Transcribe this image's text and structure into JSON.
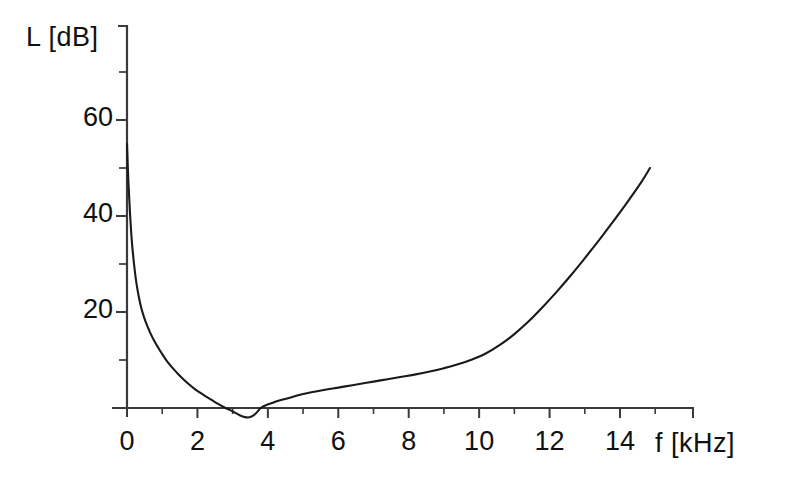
{
  "chart_data": {
    "type": "line",
    "title": "",
    "xlabel": "f [kHz]",
    "ylabel": "L [dB]",
    "xlim": [
      -0.35,
      15.55
    ],
    "ylim": [
      -6,
      80
    ],
    "grid": false,
    "legend": null,
    "x_ticks_major": [
      0,
      2,
      4,
      6,
      8,
      10,
      12,
      14
    ],
    "x_tick_labels": [
      "0",
      "2",
      "4",
      "6",
      "8",
      "10",
      "12",
      "14"
    ],
    "x_ticks_minor": [
      1,
      3,
      5,
      7,
      9,
      11,
      13,
      15
    ],
    "y_ticks_major": [
      20,
      40,
      60
    ],
    "y_tick_labels": [
      "20",
      "40",
      "60"
    ],
    "y_ticks_minor": [
      10,
      30,
      50,
      70
    ],
    "series": [
      {
        "name": "L(f)",
        "color": "#1a1a1a",
        "x": [
          0.0,
          0.04,
          0.09,
          0.14,
          0.2,
          0.26,
          0.33,
          0.4,
          0.48,
          0.57,
          0.67,
          0.78,
          0.9,
          1.02,
          1.15,
          1.3,
          1.45,
          1.6,
          1.75,
          1.9,
          2.05,
          2.2,
          2.4,
          2.6,
          2.8,
          3.0,
          3.2,
          3.35,
          3.5,
          3.65,
          3.8,
          3.95,
          4.1,
          4.3,
          4.6,
          5.0,
          5.4,
          5.8,
          6.2,
          6.6,
          7.0,
          7.4,
          7.8,
          8.2,
          8.6,
          9.0,
          9.4,
          9.8,
          10.2,
          10.6,
          11.0,
          11.4,
          11.8,
          12.2,
          12.6,
          13.0,
          13.4,
          13.8,
          14.2,
          14.6,
          14.85
        ],
        "y": [
          55.0,
          47.0,
          40.0,
          34.5,
          30.0,
          26.4,
          23.4,
          21.0,
          19.0,
          17.2,
          15.5,
          13.9,
          12.4,
          11.0,
          9.6,
          8.3,
          7.1,
          6.0,
          5.0,
          4.1,
          3.3,
          2.6,
          1.7,
          0.8,
          0.0,
          -0.7,
          -1.5,
          -1.9,
          -1.9,
          -1.2,
          0.0,
          0.6,
          1.0,
          1.5,
          2.1,
          2.9,
          3.5,
          4.0,
          4.5,
          5.0,
          5.5,
          6.0,
          6.5,
          7.0,
          7.6,
          8.3,
          9.1,
          10.1,
          11.4,
          13.2,
          15.4,
          18.0,
          21.0,
          24.2,
          27.6,
          31.2,
          34.9,
          38.8,
          42.8,
          47.0,
          50.0
        ]
      }
    ]
  },
  "axes": {
    "y_axis_name": "level-axis",
    "x_axis_name": "frequency-axis"
  },
  "colors": {
    "background": "#ffffff",
    "axis": "#3a3a3a",
    "curve": "#1a1a1a",
    "text": "#111111"
  }
}
